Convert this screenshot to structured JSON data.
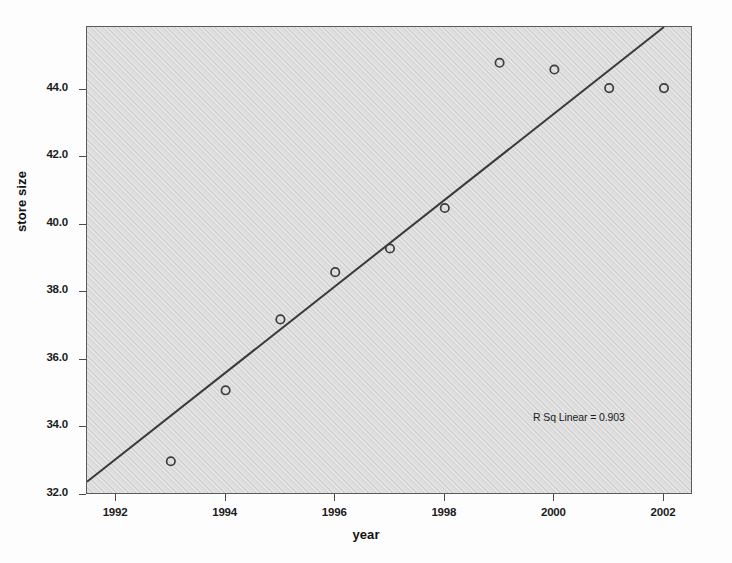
{
  "chart_data": {
    "type": "scatter",
    "title": "",
    "xlabel": "year",
    "ylabel": "store size",
    "xlim": [
      1991.47,
      2002.53
    ],
    "ylim": [
      32.0,
      45.86
    ],
    "grid": false,
    "legend": null,
    "x": [
      1993,
      1994,
      1995,
      1996,
      1997,
      1998,
      1999,
      2000,
      2001,
      2002
    ],
    "values": [
      33.0,
      35.1,
      37.2,
      38.6,
      39.3,
      40.5,
      44.8,
      44.6,
      44.05,
      44.05
    ],
    "points": [
      {
        "x": 1993,
        "y": 33.0
      },
      {
        "x": 1994,
        "y": 35.1
      },
      {
        "x": 1995,
        "y": 37.2
      },
      {
        "x": 1996,
        "y": 38.6
      },
      {
        "x": 1997,
        "y": 39.3
      },
      {
        "x": 1998,
        "y": 40.5
      },
      {
        "x": 1999,
        "y": 44.8
      },
      {
        "x": 2000,
        "y": 44.6
      },
      {
        "x": 2001,
        "y": 44.05
      },
      {
        "x": 2002,
        "y": 44.05
      }
    ],
    "xticks": [
      1992,
      1994,
      1996,
      1998,
      2000,
      2002
    ],
    "xtick_labels": [
      "1992",
      "1994",
      "1996",
      "1998",
      "2000",
      "2002"
    ],
    "yticks": [
      32.0,
      34.0,
      36.0,
      38.0,
      40.0,
      42.0,
      44.0
    ],
    "ytick_labels": [
      "32.0",
      "34.0",
      "36.0",
      "38.0",
      "40.0",
      "42.0",
      "44.0"
    ],
    "fit_line": {
      "type": "linear",
      "start": {
        "x": 1991.47,
        "y": 32.39
      },
      "end": {
        "x": 2002.0,
        "y": 45.86
      },
      "r_squared": 0.903,
      "annotation": "R Sq Linear = 0.903"
    },
    "colors": {
      "plot_background": "#dcdcdc",
      "figure_background": "#fdfdfd",
      "frame": "#5a5a5a",
      "marker_stroke": "#3c3c3c",
      "fit_line": "#3a3a3a",
      "text": "#1b1b1b"
    }
  },
  "axes": {
    "y_title": "store size",
    "x_title": "year"
  },
  "annotation": {
    "r_sq_text": "R Sq Linear = 0.903"
  }
}
